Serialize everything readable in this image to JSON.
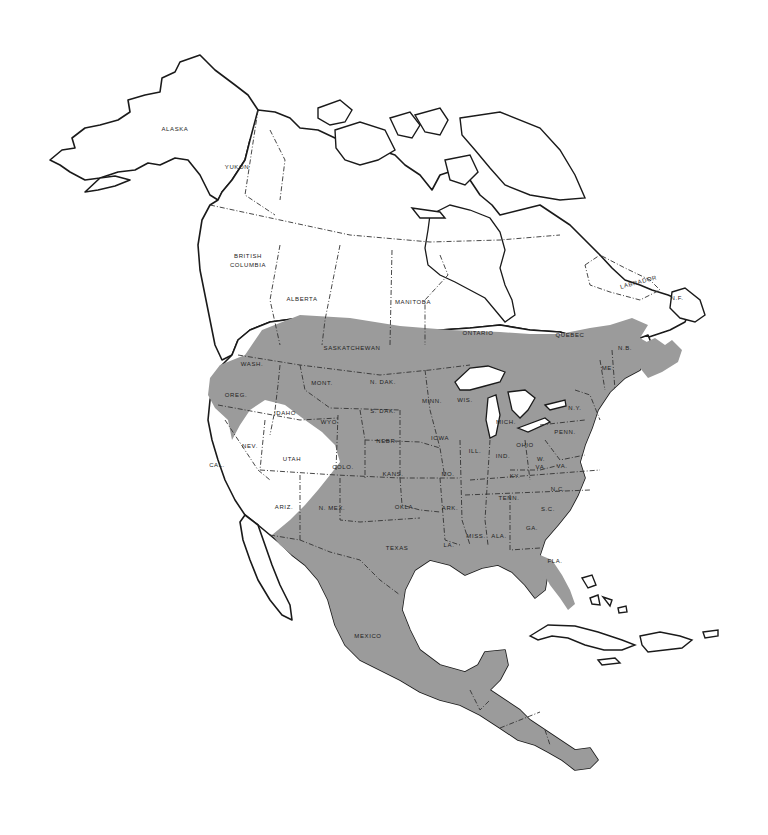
{
  "map": {
    "title": "",
    "type": "range map",
    "region": "North America",
    "colors": {
      "background": "#ffffff",
      "land": "#ffffff",
      "range_shading": "#9b9b9b",
      "outline": "#1a1a1a"
    },
    "labels": {
      "alaska": "ALASKA",
      "yukon": "YUKON",
      "british_columbia_1": "BRITISH",
      "british_columbia_2": "COLUMBIA",
      "alberta": "ALBERTA",
      "saskatchewan": "SASKATCHEWAN",
      "manitoba": "MANITOBA",
      "ontario": "ONTARIO",
      "quebec": "QUEBEC",
      "labrador": "LABRADOR",
      "nf": "N.F.",
      "nb": "N.B.",
      "me": "ME.",
      "ny": "N.Y.",
      "wash": "WASH.",
      "oreg": "OREG.",
      "cal": "CAL.",
      "idaho": "IDAHO",
      "nev": "NEV.",
      "utah": "UTAH",
      "ariz": "ARIZ.",
      "mont": "MONT.",
      "wyo": "WYO.",
      "colo": "COLO.",
      "nmex": "N. MEX.",
      "ndak": "N. DAK.",
      "sdak": "S. DAK.",
      "nebr": "NEBR.",
      "kans": "KANS.",
      "okla": "OKLA.",
      "texas": "TEXAS",
      "minn": "MINN.",
      "iowa": "IOWA",
      "mo": "MO.",
      "ark": "ARK.",
      "la": "LA.",
      "wis": "WIS.",
      "ill": "ILL.",
      "mich": "MICH.",
      "ind": "IND.",
      "ohio": "OHIO",
      "ky": "KY.",
      "tenn": "TENN.",
      "miss": "MISS.",
      "ala": "ALA.",
      "ga": "GA.",
      "fla": "FLA.",
      "sc": "S.C.",
      "nc": "N.C.",
      "va": "VA.",
      "wva_1": "W.",
      "wva_2": "VA.",
      "penn": "PENN.",
      "mexico": "MEXICO"
    }
  }
}
